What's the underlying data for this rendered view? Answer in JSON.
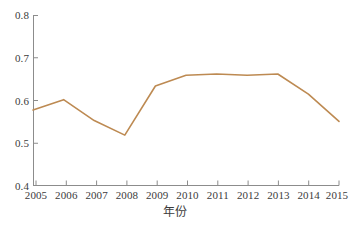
{
  "chart_data": {
    "type": "line",
    "title": "",
    "subtitle": "",
    "xlabel": "年份",
    "ylabel": "",
    "x": [
      2005,
      2006,
      2007,
      2008,
      2009,
      2010,
      2011,
      2012,
      2013,
      2014,
      2015
    ],
    "categories": [
      "2005",
      "2006",
      "2007",
      "2008",
      "2009",
      "2010",
      "2011",
      "2012",
      "2013",
      "2014",
      "2015"
    ],
    "values": [
      0.578,
      0.602,
      0.553,
      0.519,
      0.634,
      0.659,
      0.662,
      0.659,
      0.662,
      0.615,
      0.551
    ],
    "series": [
      {
        "name": "series-1",
        "color": "#bd8a52",
        "values": [
          0.578,
          0.602,
          0.553,
          0.519,
          0.634,
          0.659,
          0.662,
          0.659,
          0.662,
          0.615,
          0.551
        ]
      }
    ],
    "xlim": [
      2005,
      2015
    ],
    "ylim": [
      0.4,
      0.8
    ],
    "yticks": [
      0.4,
      0.5,
      0.6,
      0.7,
      0.8
    ],
    "ytick_labels": [
      "0.4",
      "0.5",
      "0.6",
      "0.7",
      "0.8"
    ],
    "xticks": [
      2005,
      2006,
      2007,
      2008,
      2009,
      2010,
      2011,
      2012,
      2013,
      2014,
      2015
    ],
    "xtick_labels": [
      "2005",
      "2006",
      "2007",
      "2008",
      "2009",
      "2010",
      "2011",
      "2012",
      "2013",
      "2014",
      "2015"
    ],
    "grid": false,
    "legend": null,
    "legend_position": "none",
    "annotations": [],
    "axis_color": "#808080",
    "text_color": "#3b3b3b",
    "background": "#ffffff",
    "line_width": 1.6,
    "markers": false,
    "spines": [
      "left",
      "bottom"
    ]
  },
  "figure": {
    "caption": ""
  }
}
